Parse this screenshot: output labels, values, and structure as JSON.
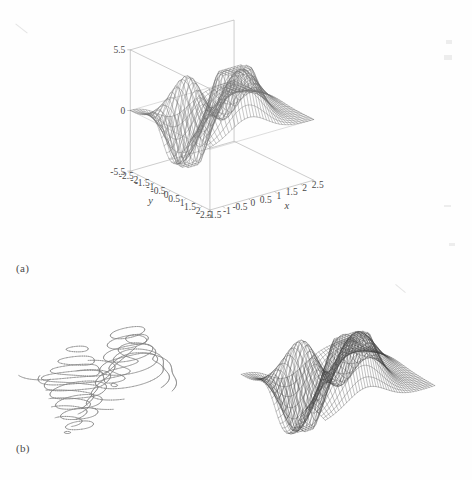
{
  "page": {
    "background": "#fefefe",
    "ink": "#4a4a4a",
    "width": 472,
    "height": 480
  },
  "panels": [
    {
      "id": "a",
      "label": "(a)"
    },
    {
      "id": "b",
      "label": "(b)"
    }
  ],
  "chart_data": [
    {
      "id": "main-surface-plot",
      "type": "surface",
      "title": "",
      "xlabel": "x",
      "ylabel": "y",
      "zlabel": "",
      "grid": true,
      "legend": "none",
      "xlim": [
        -1.5,
        2.5
      ],
      "ylim": [
        -2.5,
        2.5
      ],
      "zlim": [
        -5.5,
        5.5
      ],
      "xticks": [
        "-1.5",
        "-1",
        "-0.5",
        "0",
        "0.5",
        "1",
        "1.5",
        "2",
        "2.5"
      ],
      "xtick_values": [
        -1.5,
        -1,
        -0.5,
        0,
        0.5,
        1,
        1.5,
        2,
        2.5
      ],
      "yticks": [
        "-2.5",
        "-2",
        "-1.5",
        "-1",
        "-0.5",
        "0",
        "0.5",
        "1",
        "1.5",
        "2",
        "2.5"
      ],
      "ytick_values": [
        -2.5,
        -2,
        -1.5,
        -1,
        -0.5,
        0,
        0.5,
        1,
        1.5,
        2,
        2.5
      ],
      "zticks": [
        "5.5",
        "0",
        "-5.5"
      ],
      "ztick_values": [
        5.5,
        0,
        -5.5
      ],
      "mesh_nx": 34,
      "mesh_ny": 34,
      "function": "peaks",
      "view": {
        "azimuth": -37.5,
        "elevation": 22
      },
      "line_color": "#6e6e6e",
      "box_color": "#9a9a9a"
    },
    {
      "id": "contour3-plot",
      "type": "contour",
      "title": "",
      "xlabel": "",
      "ylabel": "",
      "grid": false,
      "legend": "none",
      "xlim": [
        -1.5,
        2.5
      ],
      "ylim": [
        -2.5,
        2.5
      ],
      "zlim": [
        -5.5,
        5.5
      ],
      "levels": [
        -5,
        -4,
        -3,
        -2,
        -1.2,
        -0.6,
        0,
        0.6,
        1.2,
        2,
        3,
        4,
        5,
        5.8
      ],
      "function": "peaks",
      "view": {
        "azimuth": -37.5,
        "elevation": 24
      },
      "line_color": "#7d7d7d"
    },
    {
      "id": "dense-mesh-plot",
      "type": "surface",
      "title": "",
      "xlabel": "",
      "ylabel": "",
      "grid": true,
      "legend": "none",
      "xlim": [
        -1.5,
        2.5
      ],
      "ylim": [
        -2.5,
        2.5
      ],
      "zlim": [
        -5.5,
        5.5
      ],
      "mesh_nx": 42,
      "mesh_ny": 42,
      "function": "peaks",
      "view": {
        "azimuth": -37.5,
        "elevation": 26
      },
      "line_color": "#3c3c3c"
    }
  ]
}
